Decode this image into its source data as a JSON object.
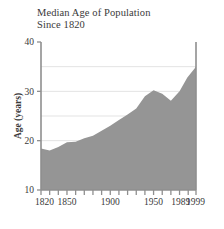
{
  "chart_data": {
    "type": "area",
    "title": "Median Age of Population",
    "subtitle": "Since 1820",
    "xlabel": "",
    "ylabel": "Age (years)",
    "xlim": [
      1820,
      1999
    ],
    "ylim": [
      10,
      40
    ],
    "ytick_labels": [
      "10",
      "20",
      "30",
      "40"
    ],
    "yticks": [
      10,
      20,
      30,
      40
    ],
    "gridlines": [
      15,
      20,
      25,
      30,
      35
    ],
    "grid": true,
    "legend": "none",
    "xtick_labels": [
      "1820",
      "1850",
      "1900",
      "1950",
      "1989",
      "1999"
    ],
    "xticks": [
      1820,
      1850,
      1900,
      1950,
      1989,
      1999
    ],
    "minor_xticks": [
      1820,
      1830,
      1840,
      1850,
      1860,
      1870,
      1880,
      1890,
      1900,
      1910,
      1920,
      1930,
      1940,
      1950,
      1960,
      1970,
      1980,
      1990,
      1999
    ],
    "x": [
      1820,
      1830,
      1840,
      1850,
      1860,
      1870,
      1880,
      1890,
      1900,
      1910,
      1920,
      1930,
      1940,
      1950,
      1960,
      1970,
      1980,
      1989,
      1999
    ],
    "values": [
      18.4,
      18.0,
      18.7,
      19.7,
      19.8,
      20.5,
      21.0,
      22.0,
      23.0,
      24.2,
      25.3,
      26.5,
      29.0,
      30.2,
      29.5,
      28.1,
      30.0,
      32.8,
      35.0
    ],
    "area_color": "#959595",
    "grid_color": "#e3e3e3",
    "axis_color": "#8f8f8f",
    "text_color": "#3a3a3a"
  }
}
